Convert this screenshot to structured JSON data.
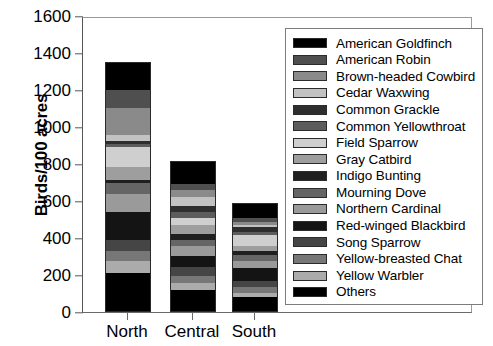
{
  "chart_data": {
    "type": "bar",
    "stacked": true,
    "title": "",
    "xlabel": "",
    "ylabel": "Birds/100 acres",
    "categories": [
      "North",
      "Central",
      "South"
    ],
    "ylim": [
      0,
      1600
    ],
    "yticks": [
      0,
      200,
      400,
      600,
      800,
      1000,
      1200,
      1400,
      1600
    ],
    "grid": false,
    "legend_position": "right-inside",
    "totals": [
      1350,
      815,
      590
    ],
    "series": [
      {
        "name": "American Goldfinch",
        "color": "#000000",
        "values": [
          150,
          120,
          80
        ]
      },
      {
        "name": "American Robin",
        "color": "#4f4f4f",
        "values": [
          95,
          35,
          22
        ]
      },
      {
        "name": "Brown-headed Cowbird",
        "color": "#8a8a8a",
        "values": [
          150,
          40,
          16
        ]
      },
      {
        "name": "Cedar Waxwing",
        "color": "#c2c2c2",
        "values": [
          30,
          48,
          10
        ]
      },
      {
        "name": "Common Grackle",
        "color": "#2e2e2e",
        "values": [
          14,
          30,
          28
        ]
      },
      {
        "name": "Common Yellowthroat",
        "color": "#5c5c5c",
        "values": [
          18,
          32,
          18
        ]
      },
      {
        "name": "Field Sparrow",
        "color": "#cfcfcf",
        "values": [
          110,
          42,
          60
        ]
      },
      {
        "name": "Gray Catbird",
        "color": "#9e9e9e",
        "values": [
          68,
          46,
          24
        ]
      },
      {
        "name": "Indigo Bunting",
        "color": "#1f1f1f",
        "values": [
          16,
          30,
          26
        ]
      },
      {
        "name": "Mourning Dove",
        "color": "#656565",
        "values": [
          60,
          35,
          30
        ]
      },
      {
        "name": "Northern Cardinal",
        "color": "#9a9a9a",
        "values": [
          100,
          55,
          38
        ]
      },
      {
        "name": "Red-winged Blackbird",
        "color": "#141414",
        "values": [
          150,
          60,
          72
        ]
      },
      {
        "name": "Song Sparrow",
        "color": "#454545",
        "values": [
          60,
          48,
          30
        ]
      },
      {
        "name": "Yellow-breasted Chat",
        "color": "#777777",
        "values": [
          55,
          38,
          34
        ]
      },
      {
        "name": "Yellow Warbler",
        "color": "#ababab",
        "values": [
          64,
          36,
          22
        ]
      },
      {
        "name": "Others",
        "color": "#000000",
        "values": [
          210,
          120,
          80
        ]
      }
    ]
  },
  "axes": {
    "y_title": "Birds/100 acres",
    "y_tick_labels": [
      "1600",
      "1400",
      "1200",
      "1000",
      "800",
      "600",
      "400",
      "200",
      "0"
    ],
    "x_tick_labels": [
      "North",
      "Central",
      "South"
    ]
  },
  "legend": {
    "entries": [
      {
        "label": "American Goldfinch",
        "color": "#000000"
      },
      {
        "label": "American Robin",
        "color": "#4f4f4f"
      },
      {
        "label": "Brown-headed Cowbird",
        "color": "#8a8a8a"
      },
      {
        "label": "Cedar Waxwing",
        "color": "#c2c2c2"
      },
      {
        "label": "Common Grackle",
        "color": "#2e2e2e"
      },
      {
        "label": "Common Yellowthroat",
        "color": "#5c5c5c"
      },
      {
        "label": "Field Sparrow",
        "color": "#cfcfcf"
      },
      {
        "label": "Gray Catbird",
        "color": "#9e9e9e"
      },
      {
        "label": "Indigo Bunting",
        "color": "#1f1f1f"
      },
      {
        "label": "Mourning Dove",
        "color": "#656565"
      },
      {
        "label": "Northern Cardinal",
        "color": "#9a9a9a"
      },
      {
        "label": "Red-winged Blackbird",
        "color": "#141414"
      },
      {
        "label": "Song Sparrow",
        "color": "#454545"
      },
      {
        "label": "Yellow-breasted Chat",
        "color": "#777777"
      },
      {
        "label": "Yellow Warbler",
        "color": "#ababab"
      },
      {
        "label": "Others",
        "color": "#000000"
      }
    ]
  }
}
